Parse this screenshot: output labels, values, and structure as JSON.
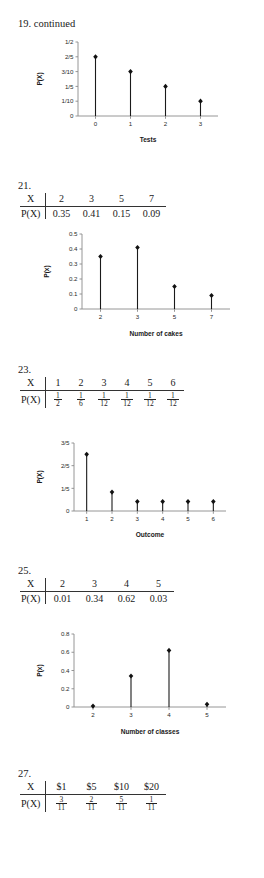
{
  "page": {
    "background": "#ffffff",
    "accent": "#111111",
    "axis_color": "#8a8a8a"
  },
  "problems": [
    {
      "id": "19",
      "heading": "19.  continued",
      "chart_data": {
        "type": "scatter",
        "title": "",
        "xlabel": "Tests",
        "ylabel": "P(X)",
        "categories": [
          "0",
          "1",
          "2",
          "3"
        ],
        "values": [
          0.4,
          0.3,
          0.2,
          0.1
        ],
        "ytick_labels": [
          "0",
          "1/10",
          "1/5",
          "3/10",
          "2/5",
          "1/2"
        ],
        "ytick_values": [
          0,
          0.1,
          0.2,
          0.3,
          0.4,
          0.5
        ],
        "ylim": [
          0,
          0.5
        ],
        "grid": false,
        "legend": "none",
        "marker": "filled-diamond-with-stem"
      }
    },
    {
      "id": "21",
      "heading": "21.",
      "table": {
        "row_labels": [
          "X",
          "P(X)"
        ],
        "x_values": [
          "2",
          "3",
          "5",
          "7"
        ],
        "p_values": [
          "0.35",
          "0.41",
          "0.15",
          "0.09"
        ]
      },
      "chart_data": {
        "type": "scatter",
        "title": "",
        "xlabel": "Number of cakes",
        "ylabel": "P(x)",
        "categories": [
          "2",
          "3",
          "5",
          "7"
        ],
        "values": [
          0.35,
          0.41,
          0.15,
          0.09
        ],
        "ytick_labels": [
          "0",
          "0.1",
          "0.2",
          "0.3",
          "0.4",
          "0.5"
        ],
        "ytick_values": [
          0,
          0.1,
          0.2,
          0.3,
          0.4,
          0.5
        ],
        "ylim": [
          0,
          0.5
        ],
        "grid": false,
        "legend": "none",
        "marker": "filled-diamond-with-stem"
      }
    },
    {
      "id": "23",
      "heading": "23.",
      "table": {
        "row_labels": [
          "X",
          "P(X)"
        ],
        "x_values": [
          "1",
          "2",
          "3",
          "4",
          "5",
          "6"
        ],
        "p_fractions": [
          {
            "num": "1",
            "den": "2"
          },
          {
            "num": "1",
            "den": "6"
          },
          {
            "num": "1",
            "den": "12"
          },
          {
            "num": "1",
            "den": "12"
          },
          {
            "num": "1",
            "den": "12"
          },
          {
            "num": "1",
            "den": "12"
          }
        ]
      },
      "chart_data": {
        "type": "scatter",
        "title": "",
        "xlabel": "Outcome",
        "ylabel": "P(X)",
        "categories": [
          "1",
          "2",
          "3",
          "4",
          "5",
          "6"
        ],
        "values": [
          0.5,
          0.1667,
          0.0833,
          0.0833,
          0.0833,
          0.0833
        ],
        "ytick_labels": [
          "0",
          "1/5",
          "2/5",
          "3/5"
        ],
        "ytick_values": [
          0,
          0.2,
          0.4,
          0.6
        ],
        "ylim": [
          0,
          0.6
        ],
        "grid": false,
        "legend": "none",
        "marker": "filled-diamond-with-stem"
      }
    },
    {
      "id": "25",
      "heading": "25.",
      "table": {
        "row_labels": [
          "X",
          "P(X)"
        ],
        "x_values": [
          "2",
          "3",
          "4",
          "5"
        ],
        "p_values": [
          "0.01",
          "0.34",
          "0.62",
          "0.03"
        ]
      },
      "chart_data": {
        "type": "scatter",
        "title": "",
        "xlabel": "Number of classes",
        "ylabel": "P(x)",
        "categories": [
          "2",
          "3",
          "4",
          "5"
        ],
        "values": [
          0.01,
          0.34,
          0.62,
          0.03
        ],
        "ytick_labels": [
          "0",
          "0.2",
          "0.4",
          "0.6",
          "0.8"
        ],
        "ytick_values": [
          0,
          0.2,
          0.4,
          0.6,
          0.8
        ],
        "ylim": [
          0,
          0.8
        ],
        "grid": false,
        "legend": "none",
        "marker": "filled-diamond-with-stem"
      }
    },
    {
      "id": "27",
      "heading": "27.",
      "table": {
        "row_labels": [
          "X",
          "P(X)"
        ],
        "x_values": [
          "$1",
          "$5",
          "$10",
          "$20"
        ],
        "p_fractions": [
          {
            "num": "3",
            "den": "11"
          },
          {
            "num": "2",
            "den": "11"
          },
          {
            "num": "5",
            "den": "11"
          },
          {
            "num": "1",
            "den": "11"
          }
        ]
      }
    }
  ]
}
